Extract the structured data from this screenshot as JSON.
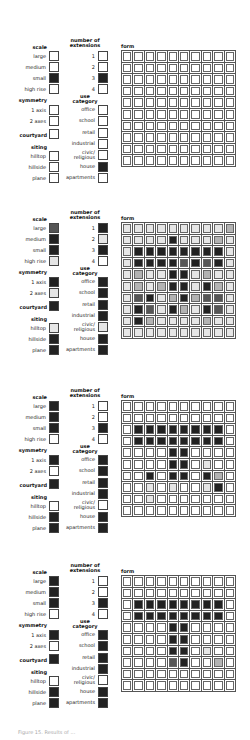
{
  "labels": {
    "scale_header": "scale",
    "extensions_header_1": "number of",
    "extensions_header_2": "extensions",
    "symmetry_header": "symmetry",
    "use_header_1": "use",
    "use_header_2": "category",
    "courtyard": "courtyard",
    "siting_header": "siting",
    "form_header": "form",
    "scale_options": [
      "large",
      "medium",
      "small",
      "high rise"
    ],
    "extension_options": [
      "1",
      "2",
      "3",
      "4"
    ],
    "symmetry_options": [
      "1 axis",
      "2 axes"
    ],
    "use_options": [
      "office",
      "school",
      "retail",
      "industrial",
      "civic/ religious",
      "house",
      "apartments"
    ],
    "siting_options": [
      "hilltop",
      "hillside",
      "plane"
    ]
  },
  "shade_legend": {
    "0": "white",
    "1": "light dotted",
    "2": "medium gray",
    "3": "dark gray",
    "4": "black"
  },
  "colors": {
    "black": "#222222",
    "dark": "#555555",
    "medium": "#b3b3b3",
    "light": "#e6e6e6",
    "white": "#ffffff"
  },
  "panels": [
    {
      "scale": [
        0,
        0,
        4,
        0
      ],
      "extensions": [
        0,
        0,
        4,
        0
      ],
      "symmetry": [
        0,
        0
      ],
      "courtyard": 0,
      "use": [
        0,
        0,
        0,
        0,
        0,
        4,
        0
      ],
      "siting": [
        0,
        0,
        0
      ],
      "form": [
        [
          0,
          0,
          0,
          0,
          0,
          0,
          0,
          0,
          0,
          0
        ],
        [
          0,
          0,
          0,
          0,
          0,
          0,
          0,
          0,
          0,
          0
        ],
        [
          0,
          0,
          0,
          0,
          0,
          0,
          0,
          0,
          0,
          0
        ],
        [
          0,
          0,
          0,
          0,
          0,
          0,
          0,
          0,
          0,
          0
        ],
        [
          0,
          0,
          0,
          0,
          0,
          0,
          0,
          0,
          0,
          0
        ],
        [
          0,
          0,
          0,
          0,
          0,
          0,
          0,
          0,
          0,
          0
        ],
        [
          0,
          0,
          0,
          0,
          0,
          0,
          0,
          0,
          0,
          0
        ],
        [
          0,
          0,
          0,
          0,
          0,
          0,
          0,
          0,
          0,
          0
        ],
        [
          0,
          0,
          0,
          0,
          0,
          0,
          0,
          0,
          0,
          0
        ],
        [
          0,
          0,
          0,
          0,
          0,
          0,
          0,
          0,
          0,
          0
        ]
      ]
    },
    {
      "scale": [
        3,
        4,
        4,
        1
      ],
      "extensions": [
        4,
        1,
        4,
        0
      ],
      "symmetry": [
        4,
        1
      ],
      "courtyard": 4,
      "use": [
        4,
        4,
        4,
        4,
        1,
        4,
        4
      ],
      "siting": [
        1,
        4,
        4
      ],
      "form": [
        [
          1,
          1,
          1,
          1,
          1,
          1,
          1,
          1,
          1,
          2
        ],
        [
          1,
          1,
          1,
          1,
          4,
          1,
          1,
          1,
          2,
          1
        ],
        [
          1,
          4,
          4,
          4,
          4,
          4,
          4,
          4,
          4,
          1
        ],
        [
          1,
          4,
          4,
          4,
          4,
          3,
          4,
          3,
          4,
          1
        ],
        [
          1,
          2,
          1,
          1,
          4,
          4,
          1,
          2,
          1,
          1
        ],
        [
          1,
          2,
          1,
          2,
          4,
          4,
          1,
          4,
          2,
          1
        ],
        [
          1,
          3,
          4,
          1,
          2,
          4,
          2,
          3,
          3,
          1
        ],
        [
          1,
          4,
          3,
          1,
          4,
          2,
          1,
          4,
          3,
          1
        ],
        [
          1,
          4,
          2,
          1,
          1,
          1,
          1,
          2,
          1,
          1
        ],
        [
          1,
          1,
          1,
          1,
          1,
          1,
          1,
          1,
          1,
          1
        ]
      ]
    },
    {
      "scale": [
        4,
        4,
        4,
        0
      ],
      "extensions": [
        0,
        0,
        4,
        0
      ],
      "symmetry": [
        4,
        0
      ],
      "courtyard": 4,
      "use": [
        4,
        4,
        4,
        4,
        0,
        4,
        4
      ],
      "siting": [
        0,
        4,
        4
      ],
      "form": [
        [
          0,
          0,
          0,
          0,
          0,
          0,
          0,
          0,
          0,
          0
        ],
        [
          0,
          0,
          0,
          0,
          0,
          0,
          0,
          0,
          0,
          0
        ],
        [
          0,
          4,
          4,
          4,
          4,
          4,
          4,
          4,
          4,
          0
        ],
        [
          0,
          4,
          4,
          4,
          4,
          4,
          4,
          4,
          4,
          0
        ],
        [
          0,
          0,
          0,
          0,
          4,
          4,
          0,
          0,
          0,
          0
        ],
        [
          0,
          0,
          0,
          0,
          4,
          4,
          0,
          1,
          0,
          0
        ],
        [
          0,
          0,
          4,
          0,
          4,
          4,
          0,
          4,
          2,
          0
        ],
        [
          0,
          0,
          1,
          0,
          1,
          0,
          0,
          1,
          4,
          0
        ],
        [
          0,
          0,
          1,
          0,
          0,
          0,
          0,
          0,
          0,
          0
        ],
        [
          0,
          0,
          0,
          0,
          0,
          0,
          0,
          0,
          0,
          0
        ]
      ]
    },
    {
      "scale": [
        4,
        4,
        4,
        0
      ],
      "extensions": [
        0,
        0,
        4,
        0
      ],
      "symmetry": [
        4,
        0
      ],
      "courtyard": 4,
      "use": [
        4,
        4,
        4,
        4,
        0,
        4,
        4
      ],
      "siting": [
        0,
        4,
        4
      ],
      "form": [
        [
          0,
          0,
          0,
          0,
          0,
          0,
          0,
          0,
          0,
          0
        ],
        [
          0,
          0,
          0,
          0,
          0,
          0,
          0,
          0,
          0,
          0
        ],
        [
          0,
          4,
          4,
          4,
          4,
          4,
          4,
          4,
          4,
          0
        ],
        [
          0,
          4,
          4,
          4,
          4,
          4,
          4,
          4,
          4,
          0
        ],
        [
          0,
          0,
          0,
          0,
          4,
          4,
          0,
          0,
          0,
          0
        ],
        [
          0,
          0,
          0,
          0,
          4,
          4,
          0,
          0,
          0,
          0
        ],
        [
          0,
          0,
          0,
          0,
          4,
          4,
          0,
          1,
          0,
          0
        ],
        [
          0,
          0,
          0,
          0,
          3,
          4,
          0,
          0,
          2,
          0
        ],
        [
          0,
          0,
          0,
          0,
          0,
          0,
          0,
          0,
          0,
          0
        ],
        [
          0,
          0,
          0,
          0,
          0,
          0,
          0,
          0,
          0,
          0
        ]
      ]
    }
  ],
  "caption": "Figure 15. Results of ..."
}
